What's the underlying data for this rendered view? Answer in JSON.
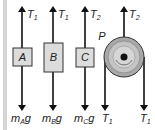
{
  "diagram": {
    "type": "free-body diagrams",
    "colors": {
      "block_fill": "#dcdcdc",
      "block_border": "#333333",
      "arrow": "#111111",
      "pulley_outer": "#a8a8a8",
      "pulley_inner": "#c8c8c8",
      "side_bar": "#d4d4d4"
    },
    "blocks": [
      {
        "name": "A",
        "top_label": "T",
        "top_sub": "1",
        "bottom_label": "m",
        "bottom_sub": "A",
        "bottom_suffix": "g"
      },
      {
        "name": "B",
        "top_label": "T",
        "top_sub": "1",
        "bottom_label": "m",
        "bottom_sub": "B",
        "bottom_suffix": "g"
      },
      {
        "name": "C",
        "top_label": "T",
        "top_sub": "2",
        "bottom_label": "m",
        "bottom_sub": "C",
        "bottom_suffix": "g"
      }
    ],
    "pulley": {
      "name": "P",
      "top_label": "T",
      "top_sub": "2",
      "bottom_left_label": "T",
      "bottom_left_sub": "1",
      "bottom_right_label": "T",
      "bottom_right_sub": "1"
    }
  }
}
